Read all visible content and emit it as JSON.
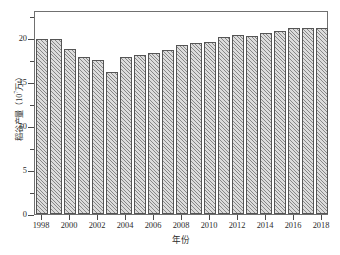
{
  "chart_data": {
    "type": "bar",
    "title": "",
    "subtitle": "",
    "xlabel": "年份",
    "ylabel": "稻谷产量（10⁷万t）",
    "ylabel_prefix": "稻谷产量（10",
    "ylabel_exponent": "7",
    "ylabel_suffix": "万t）",
    "categories": [
      "1998",
      "1999",
      "2000",
      "2001",
      "2002",
      "2003",
      "2004",
      "2005",
      "2006",
      "2007",
      "2008",
      "2009",
      "2010",
      "2011",
      "2012",
      "2013",
      "2014",
      "2015",
      "2016",
      "2017",
      "2018"
    ],
    "values": [
      19.9,
      19.9,
      18.8,
      17.8,
      17.5,
      16.1,
      17.9,
      18.1,
      18.3,
      18.6,
      19.2,
      19.5,
      19.6,
      20.1,
      20.4,
      20.3,
      20.6,
      20.8,
      21.1,
      21.2,
      21.2
    ],
    "series": [
      {
        "name": "稻谷产量",
        "values": [
          19.9,
          19.9,
          18.8,
          17.8,
          17.5,
          16.1,
          17.9,
          18.1,
          18.3,
          18.6,
          19.2,
          19.5,
          19.6,
          20.1,
          20.4,
          20.3,
          20.6,
          20.8,
          21.1,
          21.2,
          21.2
        ]
      }
    ],
    "ylim": [
      0,
      23.2
    ],
    "xlim_categories": 21,
    "y_ticks_major": [
      0,
      5,
      10,
      15,
      20
    ],
    "y_tick_labels": [
      "0",
      "5",
      "10",
      "15",
      "20"
    ],
    "y_ticks_minor": [
      2.5,
      7.5,
      12.5,
      17.5,
      22.5
    ],
    "x_tick_labels": [
      "1998",
      "2000",
      "2002",
      "2004",
      "2006",
      "2008",
      "2010",
      "2012",
      "2014",
      "2016",
      "2018"
    ],
    "x_tick_category_indices": [
      0,
      2,
      4,
      6,
      8,
      10,
      12,
      14,
      16,
      18,
      20
    ],
    "grid": false,
    "legend": null,
    "legend_position": "none",
    "bar_fill_color": "#dcdcdc",
    "bar_edge_color": "#555555",
    "bar_hatch": "diagonal-lines",
    "axis_color": "#707070",
    "background_color": "#ffffff"
  }
}
